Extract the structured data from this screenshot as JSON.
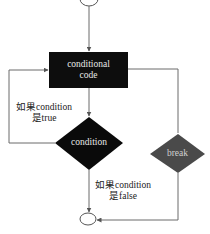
{
  "diagram": {
    "type": "flowchart",
    "colors": {
      "background": "#ffffff",
      "line": "#6b6b6b",
      "process_fill": "#0d0d0d",
      "condition_fill": "#0a0a0a",
      "break_fill": "#4a4a4a",
      "node_text": "#e8e8e8",
      "label_text": "#222222"
    },
    "nodes": {
      "start": {
        "shape": "oval",
        "label": ""
      },
      "process": {
        "shape": "rectangle",
        "line1": "conditional",
        "line2": "code"
      },
      "condition": {
        "shape": "diamond",
        "label": "condition"
      },
      "break": {
        "shape": "diamond",
        "label": "break"
      },
      "end": {
        "shape": "oval",
        "label": ""
      }
    },
    "edge_labels": {
      "true_line1": "如果condition",
      "true_line2": "是true",
      "false_line1": "如果condition",
      "false_line2": "是false"
    }
  }
}
